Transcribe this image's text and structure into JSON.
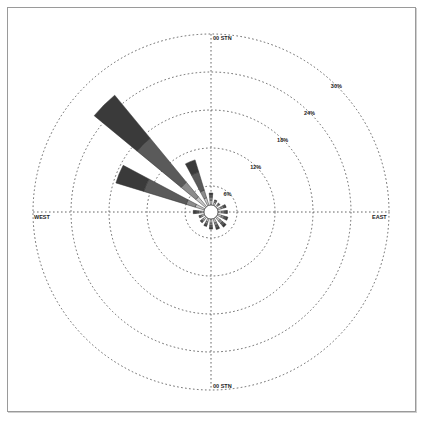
{
  "chart_data": {
    "type": "windrose",
    "title": "",
    "center": [
      211,
      212
    ],
    "ring_labels": [
      "6%",
      "12%",
      "18%",
      "24%",
      "30%"
    ],
    "ring_values": [
      6,
      12,
      18,
      24,
      30
    ],
    "direction_labels": {
      "north": "00 STN",
      "east": "EAST",
      "south": "00 STN",
      "west": "WEST"
    },
    "speed_bins_colors": [
      "#ffffff",
      "#c8c8c8",
      "#8c8c8c",
      "#5a5a5a",
      "#3a3a3a"
    ],
    "petals": [
      {
        "dir": 0,
        "pct": 3.8,
        "segments": [
          1.5,
          1.0,
          0.8,
          0.5
        ]
      },
      {
        "dir": 22.5,
        "pct": 1.8,
        "segments": [
          1.0,
          0.5,
          0.3
        ]
      },
      {
        "dir": 45,
        "pct": 1.5,
        "segments": [
          0.8,
          0.4,
          0.3
        ]
      },
      {
        "dir": 67.5,
        "pct": 2.8,
        "segments": [
          1.2,
          0.8,
          0.5,
          0.3
        ]
      },
      {
        "dir": 90,
        "pct": 3.0,
        "segments": [
          1.2,
          0.8,
          0.6,
          0.4
        ]
      },
      {
        "dir": 112.5,
        "pct": 3.4,
        "segments": [
          1.3,
          0.9,
          0.7,
          0.5
        ]
      },
      {
        "dir": 135,
        "pct": 4.0,
        "segments": [
          1.5,
          1.0,
          0.9,
          0.6
        ]
      },
      {
        "dir": 157.5,
        "pct": 3.6,
        "segments": [
          1.4,
          0.9,
          0.8,
          0.5
        ]
      },
      {
        "dir": 180,
        "pct": 3.2,
        "segments": [
          1.3,
          0.8,
          0.7,
          0.4
        ]
      },
      {
        "dir": 202.5,
        "pct": 2.6,
        "segments": [
          1.1,
          0.7,
          0.5,
          0.3
        ]
      },
      {
        "dir": 225,
        "pct": 2.2,
        "segments": [
          1.0,
          0.6,
          0.4,
          0.2
        ]
      },
      {
        "dir": 247.5,
        "pct": 1.8,
        "segments": [
          0.9,
          0.5,
          0.4
        ]
      },
      {
        "dir": 270,
        "pct": 3.4,
        "segments": [
          1.0,
          0.8,
          0.8,
          0.8
        ]
      },
      {
        "dir": 292.5,
        "pct": 17.6,
        "segments": [
          3.0,
          3.0,
          7.0,
          4.6
        ]
      },
      {
        "dir": 315,
        "pct": 25.8,
        "segments": [
          4.0,
          4.0,
          9.0,
          8.8
        ]
      },
      {
        "dir": 337.5,
        "pct": 10.5,
        "segments": [
          2.5,
          2.5,
          3.5,
          2.0
        ]
      }
    ],
    "legend": []
  }
}
